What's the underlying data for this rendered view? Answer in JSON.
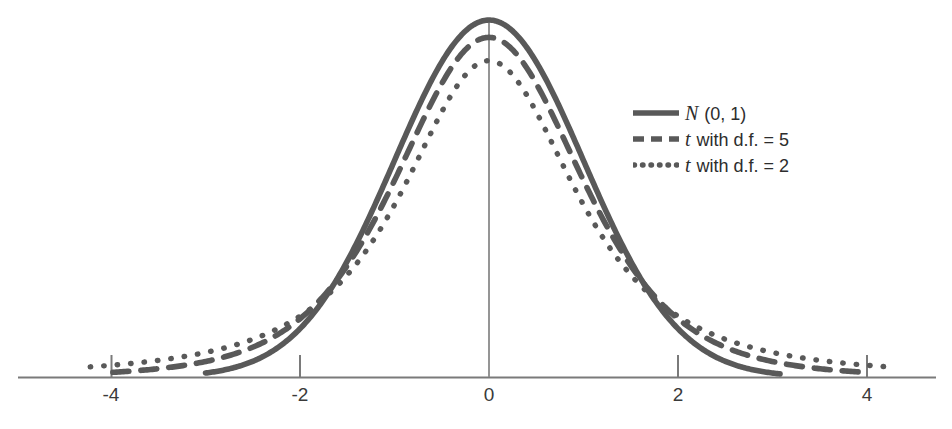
{
  "chart_data": {
    "type": "line",
    "title": "",
    "subtitle": "",
    "xlabel": "",
    "ylabel": "",
    "xlim": [
      -4.9,
      4.9
    ],
    "ylim": [
      0,
      0.42
    ],
    "grid": false,
    "legend_position": "upper right",
    "x_ticks": [
      "-4",
      "-2",
      "0",
      "2",
      "4"
    ],
    "x_tick_values": [
      -4,
      -2,
      0,
      2,
      4
    ],
    "y_ticks": [],
    "annotations": [
      "vertical line at x = 0 from axis up to the N(0,1) peak"
    ],
    "series": [
      {
        "name": "N (0, 1)",
        "style": "solid",
        "color": "#595959",
        "peak": 0.399,
        "x": [
          -3.0,
          -2.75,
          -2.5,
          -2.25,
          -2.0,
          -1.75,
          -1.5,
          -1.25,
          -1.0,
          -0.75,
          -0.5,
          -0.25,
          0.0,
          0.25,
          0.5,
          0.75,
          1.0,
          1.25,
          1.5,
          1.75,
          2.0,
          2.25,
          2.5,
          2.75,
          3.0
        ],
        "values": [
          0.0044,
          0.0091,
          0.0175,
          0.0317,
          0.054,
          0.0863,
          0.1295,
          0.1826,
          0.242,
          0.3011,
          0.3521,
          0.3867,
          0.3989,
          0.3867,
          0.3521,
          0.3011,
          0.242,
          0.1826,
          0.1295,
          0.0863,
          0.054,
          0.0317,
          0.0175,
          0.0091,
          0.0044
        ]
      },
      {
        "name": "t with d.f. = 5",
        "style": "dashed",
        "color": "#595959",
        "peak": 0.3796,
        "x": [
          -4.0,
          -3.5,
          -3.0,
          -2.5,
          -2.0,
          -1.5,
          -1.0,
          -0.5,
          0.0,
          0.5,
          1.0,
          1.5,
          2.0,
          2.5,
          3.0,
          3.5,
          4.0
        ],
        "values": [
          0.0051,
          0.0094,
          0.0173,
          0.0337,
          0.0651,
          0.1245,
          0.2197,
          0.3279,
          0.3796,
          0.3279,
          0.2197,
          0.1245,
          0.0651,
          0.0337,
          0.0173,
          0.0094,
          0.0051
        ]
      },
      {
        "name": "t with d.f. = 2",
        "style": "dotted",
        "color": "#595959",
        "peak": 0.3536,
        "x": [
          -4.25,
          -3.75,
          -3.25,
          -2.75,
          -2.25,
          -1.75,
          -1.25,
          -0.75,
          -0.25,
          0.25,
          0.75,
          1.25,
          1.75,
          2.25,
          2.75,
          3.25,
          3.75,
          4.25
        ],
        "values": [
          0.0128,
          0.0172,
          0.0243,
          0.0357,
          0.0557,
          0.0929,
          0.1629,
          0.2676,
          0.3432,
          0.3432,
          0.2676,
          0.1629,
          0.0929,
          0.0557,
          0.0357,
          0.0243,
          0.0172,
          0.0128
        ]
      }
    ]
  },
  "legend": {
    "items": [
      {
        "symbol": "N",
        "label": " (0, 1)",
        "style": "solid"
      },
      {
        "symbol": "t",
        "label": " with d.f. = 5",
        "style": "dashed"
      },
      {
        "symbol": "t",
        "label": " with d.f. = 2",
        "style": "dotted"
      }
    ]
  },
  "axis": {
    "line_color": "#7a7a7a",
    "tick_labels": [
      "-4",
      "-2",
      "0",
      "2",
      "4"
    ]
  },
  "colors": {
    "curve": "#595959",
    "axis": "#7a7a7a",
    "text": "#2d2d2d",
    "background": "#ffffff"
  }
}
